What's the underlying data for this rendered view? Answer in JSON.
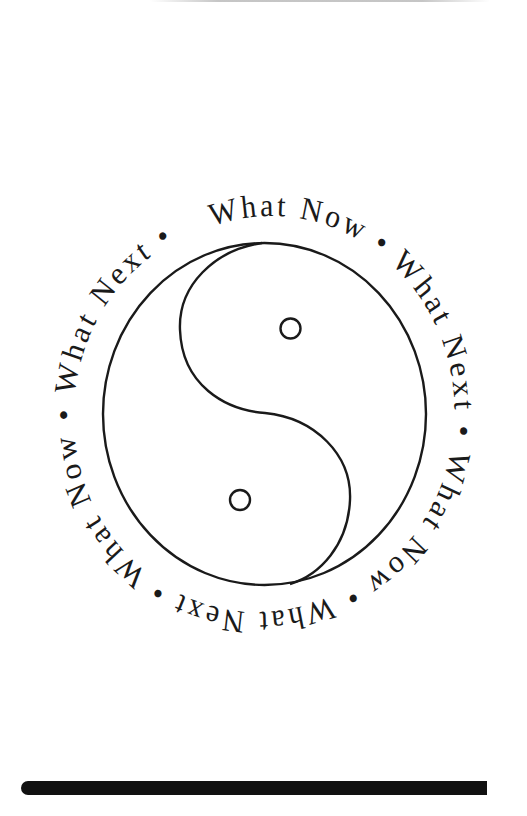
{
  "page": {
    "background": "#ffffff",
    "ink_color": "#1a1a1a"
  },
  "emblem": {
    "symbol": "yin-yang-icon",
    "ring_text": "What Now • What Next • What Now • What Next • What Now • What Next • ",
    "ring_segments": [
      "What Now",
      "What Next",
      "What Now",
      "What Next",
      "What Now",
      "What Next"
    ],
    "separator": "•"
  },
  "footer": {
    "rule_color": "#111111"
  }
}
